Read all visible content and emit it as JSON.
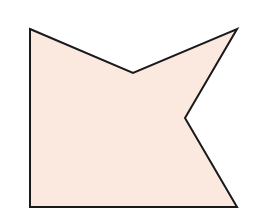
{
  "diagram": {
    "type": "polygon",
    "shape": "concave-hexagon",
    "fill": "#FBE9DF",
    "stroke": "#1A1A1A",
    "stroke_width": 2,
    "vertices": [
      {
        "x": 30,
        "y": 29
      },
      {
        "x": 133,
        "y": 73
      },
      {
        "x": 237,
        "y": 29
      },
      {
        "x": 185,
        "y": 118
      },
      {
        "x": 237,
        "y": 207
      },
      {
        "x": 30,
        "y": 207
      }
    ]
  }
}
